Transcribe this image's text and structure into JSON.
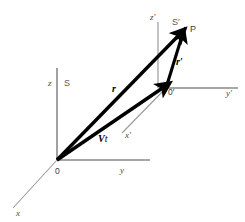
{
  "figure": {
    "kind": "physics-reference-frames-diagram"
  },
  "colors": {
    "axis": "#8a8a8a",
    "axis_dark": "#6e6e6e",
    "vector": "#000000",
    "label": "#3a3a3a",
    "background": "#ffffff"
  },
  "frames": [
    {
      "id": "S",
      "label": "S",
      "x": 64,
      "y": 86
    },
    {
      "id": "Sp",
      "label": "S′",
      "x": 172,
      "y": 25
    }
  ],
  "origins": [
    {
      "id": "O",
      "label": "0",
      "x": 55,
      "y": 174,
      "px": 57,
      "py": 160
    },
    {
      "id": "Op",
      "label": "0′",
      "x": 168,
      "y": 95,
      "px": 166,
      "py": 88
    }
  ],
  "points": [
    {
      "id": "P",
      "label": "P",
      "x": 190,
      "y": 32,
      "px": 183,
      "py": 31
    }
  ],
  "axes": [
    {
      "id": "z",
      "label": "z",
      "label_x": 48,
      "label_y": 86,
      "x1": 57,
      "y1": 160,
      "x2": 57,
      "y2": 68
    },
    {
      "id": "y",
      "label": "y",
      "label_x": 120,
      "label_y": 173,
      "x1": 57,
      "y1": 160,
      "x2": 150,
      "y2": 160
    },
    {
      "id": "x",
      "label": "x",
      "label_x": 16,
      "label_y": 216,
      "x1": 57,
      "y1": 160,
      "x2": 13,
      "y2": 208
    },
    {
      "id": "zp",
      "label": "z′",
      "label_x": 150,
      "label_y": 20,
      "x1": 158,
      "y1": 88,
      "x2": 158,
      "y2": 22
    },
    {
      "id": "yp",
      "label": "y′",
      "label_x": 226,
      "label_y": 96,
      "x1": 166,
      "y1": 88,
      "x2": 238,
      "y2": 88
    },
    {
      "id": "xp",
      "label": "x′",
      "label_x": 125,
      "label_y": 138,
      "x1": 166,
      "y1": 88,
      "x2": 122,
      "y2": 133
    }
  ],
  "vectors": [
    {
      "id": "r",
      "label": "r",
      "label_x": 112,
      "label_y": 92,
      "from": "O",
      "to": "P",
      "x1": 57,
      "y1": 160,
      "x2": 180,
      "y2": 34
    },
    {
      "id": "rp",
      "label": "r′",
      "label_x": 176,
      "label_y": 65,
      "from": "Op",
      "to": "P",
      "x1": 166,
      "y1": 88,
      "x2": 182,
      "y2": 36
    },
    {
      "id": "vt",
      "label_v": "V",
      "label_t": "t",
      "label_x": 98,
      "label_y": 142,
      "from": "O",
      "to": "Op",
      "x1": 57,
      "y1": 160,
      "x2": 164,
      "y2": 87
    }
  ]
}
